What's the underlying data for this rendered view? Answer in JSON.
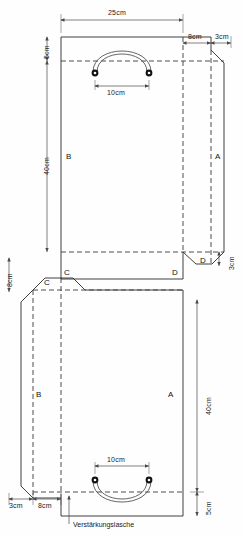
{
  "document": {
    "kind": "technical-pattern-drawing",
    "subject": "Papiertuete Schnittmuster",
    "units": "cm"
  },
  "dimensions": {
    "top_width": "25cm",
    "top_flap_left": "5cm",
    "glue_tab": "8cm",
    "side_tab": "3cm",
    "handle_span_top": "10cm",
    "body_height_upper": "40cm",
    "gusset_tab_right": "3cm",
    "left_gusset": "8cm",
    "bottom_left_small": "3cm",
    "bottom_left_mid": "8cm",
    "body_height_lower": "40cm",
    "bottom_flap": "5cm",
    "handle_span_bottom": "10cm"
  },
  "panels": {
    "a_upper": "A",
    "a_lower": "A",
    "b_upper": "B",
    "b_lower": "B",
    "c_right": "C",
    "c_tab": "C",
    "c_mid": "C",
    "d_left": "D",
    "d_tab": "D"
  },
  "annotations": {
    "reinforcement_tab": "Verstärkungslasche"
  },
  "colors": {
    "cut_line": "#2b2b2b",
    "fold_line": "#3a3a3a",
    "dimension_line": "#4a4a4a",
    "handle": "#555555",
    "eyelet": "#111111",
    "background": "#fefefe"
  }
}
